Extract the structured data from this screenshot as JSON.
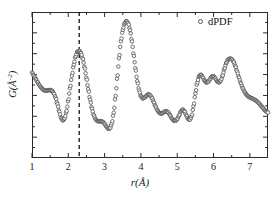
{
  "figure": {
    "xlabel": "r(Å)",
    "ylabel": "G(Å-2)",
    "ylabel_base": "G(Å",
    "ylabel_exp": "-2",
    "ylabel_close": ")"
  },
  "legend": {
    "label": "dPDF",
    "marker": "open-circle-marker",
    "position": "top-right"
  },
  "axis": {
    "x_tick_labels": [
      "1",
      "2",
      "3",
      "4",
      "5",
      "6",
      "7"
    ],
    "x_tick_values": [
      1,
      2,
      3,
      4,
      5,
      6,
      7
    ],
    "y_tick_labels": [],
    "x_minor_ticks": true,
    "y_minor_ticks": true
  },
  "colors": {
    "curve": "#4a4a4a",
    "marker_edge": "#555555",
    "marker_face": "#ffffff",
    "axis": "#2b2b2b",
    "dashed_line": "#111111",
    "background": "#ffffff"
  },
  "annotations": [
    {
      "name": "vertical-dashed-line",
      "type": "vline",
      "x": 2.3,
      "style": "dashed"
    }
  ],
  "chart_data": {
    "type": "scatter",
    "title": "",
    "xlabel": "r(Å)",
    "ylabel": "G(Å-2)",
    "xlim": [
      1.0,
      7.5
    ],
    "ylim": [
      0.0,
      1.06
    ],
    "grid": false,
    "legend_position": "upper right",
    "series": [
      {
        "name": "dPDF",
        "marker": "o",
        "x": [
          1.0,
          1.05,
          1.1,
          1.15,
          1.2,
          1.25,
          1.3,
          1.35,
          1.4,
          1.45,
          1.5,
          1.55,
          1.6,
          1.65,
          1.7,
          1.75,
          1.8,
          1.85,
          1.9,
          1.95,
          2.0,
          2.05,
          2.1,
          2.15,
          2.2,
          2.25,
          2.3,
          2.35,
          2.4,
          2.45,
          2.5,
          2.55,
          2.6,
          2.65,
          2.7,
          2.75,
          2.8,
          2.85,
          2.9,
          2.95,
          3.0,
          3.05,
          3.1,
          3.15,
          3.2,
          3.25,
          3.3,
          3.35,
          3.4,
          3.45,
          3.5,
          3.55,
          3.6,
          3.65,
          3.7,
          3.75,
          3.8,
          3.85,
          3.9,
          3.95,
          4.0,
          4.05,
          4.1,
          4.15,
          4.2,
          4.25,
          4.3,
          4.35,
          4.4,
          4.45,
          4.5,
          4.55,
          4.6,
          4.65,
          4.7,
          4.75,
          4.8,
          4.85,
          4.9,
          4.95,
          5.0,
          5.05,
          5.1,
          5.15,
          5.2,
          5.25,
          5.3,
          5.35,
          5.4,
          5.45,
          5.5,
          5.55,
          5.6,
          5.65,
          5.7,
          5.75,
          5.8,
          5.85,
          5.9,
          5.95,
          6.0,
          6.05,
          6.1,
          6.15,
          6.2,
          6.25,
          6.3,
          6.35,
          6.4,
          6.45,
          6.5,
          6.55,
          6.6,
          6.65,
          6.7,
          6.75,
          6.8,
          6.85,
          6.9,
          6.95,
          7.0,
          7.05,
          7.1,
          7.15,
          7.2,
          7.25,
          7.3,
          7.35,
          7.4,
          7.45,
          7.5
        ],
        "y": [
          0.62,
          0.598,
          0.575,
          0.552,
          0.53,
          0.512,
          0.498,
          0.49,
          0.488,
          0.492,
          0.494,
          0.488,
          0.47,
          0.438,
          0.392,
          0.338,
          0.292,
          0.272,
          0.288,
          0.34,
          0.42,
          0.51,
          0.598,
          0.678,
          0.738,
          0.772,
          0.78,
          0.762,
          0.718,
          0.655,
          0.58,
          0.5,
          0.424,
          0.36,
          0.312,
          0.282,
          0.268,
          0.266,
          0.268,
          0.262,
          0.248,
          0.228,
          0.212,
          0.216,
          0.252,
          0.33,
          0.448,
          0.59,
          0.73,
          0.848,
          0.93,
          0.978,
          0.995,
          0.978,
          0.928,
          0.848,
          0.748,
          0.648,
          0.558,
          0.49,
          0.448,
          0.432,
          0.438,
          0.452,
          0.462,
          0.458,
          0.438,
          0.408,
          0.376,
          0.348,
          0.33,
          0.322,
          0.326,
          0.336,
          0.34,
          0.332,
          0.312,
          0.288,
          0.272,
          0.27,
          0.282,
          0.308,
          0.338,
          0.352,
          0.34,
          0.31,
          0.282,
          0.278,
          0.308,
          0.378,
          0.468,
          0.548,
          0.595,
          0.605,
          0.588,
          0.562,
          0.548,
          0.552,
          0.572,
          0.592,
          0.595,
          0.578,
          0.556,
          0.548,
          0.562,
          0.598,
          0.648,
          0.69,
          0.715,
          0.722,
          0.718,
          0.7,
          0.668,
          0.628,
          0.585,
          0.545,
          0.51,
          0.482,
          0.462,
          0.448,
          0.44,
          0.434,
          0.428,
          0.42,
          0.41,
          0.398,
          0.382,
          0.366,
          0.35,
          0.338,
          0.33
        ]
      }
    ]
  }
}
